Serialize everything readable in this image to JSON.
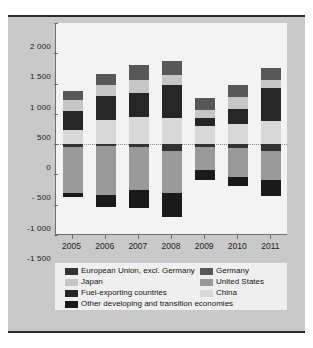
{
  "figure": {
    "panel_color": "#c9c9c9",
    "plot_bg": "#f3f3f3",
    "rule_color": "#2b2b2b"
  },
  "chart_data": {
    "type": "bar",
    "subtype": "stacked-bar-diverging",
    "title": "",
    "subtitle": "",
    "xlabel": "",
    "ylabel": "",
    "categories": [
      "2005",
      "2006",
      "2007",
      "2008",
      "2009",
      "2010",
      "2011"
    ],
    "ylim": [
      -1500,
      2000
    ],
    "yticks": [
      2000,
      1500,
      1000,
      500,
      0,
      -500,
      -1000,
      -1500
    ],
    "ytick_labels": [
      "2 000",
      "1 500",
      "1 000",
      "500",
      "0",
      "- 500",
      "-1 000",
      "-1 500"
    ],
    "grid": false,
    "zero_line": true,
    "legend_position": "bottom",
    "series": [
      {
        "name": "European Union, excl. Germany",
        "key": "eu_excl_germany",
        "color": "#333333",
        "values": [
          -55,
          -35,
          -40,
          -110,
          -40,
          -70,
          -120
        ]
      },
      {
        "name": "Germany",
        "key": "germany",
        "color": "#585858",
        "values": [
          145,
          190,
          250,
          235,
          200,
          200,
          205
        ]
      },
      {
        "name": "Japan",
        "key": "japan",
        "color": "#c6c6c6",
        "values": [
          170,
          175,
          210,
          155,
          145,
          205,
          125
        ]
      },
      {
        "name": "United States",
        "key": "united_states",
        "color": "#9a9a9a",
        "values": [
          -745,
          -805,
          -715,
          -700,
          -380,
          -470,
          -465
        ]
      },
      {
        "name": "Fuel-exporting countries",
        "key": "fuel_exporting",
        "color": "#262626",
        "values": [
          325,
          400,
          410,
          555,
          125,
          245,
          555
        ]
      },
      {
        "name": "China",
        "key": "china",
        "color": "#d8d8d8",
        "values": [
          230,
          395,
          440,
          425,
          300,
          330,
          375
        ]
      },
      {
        "name": "Other developing and transition economies",
        "key": "other_dev_transition",
        "color": "#1a1a1a",
        "values": [
          -75,
          -190,
          -300,
          -385,
          -175,
          -155,
          -270
        ]
      }
    ],
    "stack_order_positive": [
      "china",
      "fuel_exporting",
      "japan",
      "germany"
    ],
    "stack_order_negative": [
      "eu_excl_germany",
      "united_states",
      "other_dev_transition"
    ]
  },
  "legend": {
    "entries": [
      {
        "label": "European Union, excl. Germany",
        "color": "#333333",
        "row": 0,
        "col": 0
      },
      {
        "label": "Germany",
        "color": "#585858",
        "row": 0,
        "col": 1
      },
      {
        "label": "Japan",
        "color": "#c6c6c6",
        "row": 1,
        "col": 0
      },
      {
        "label": "United States",
        "color": "#9a9a9a",
        "row": 1,
        "col": 1
      },
      {
        "label": "Fuel-exporting countries",
        "color": "#262626",
        "row": 2,
        "col": 0
      },
      {
        "label": "China",
        "color": "#d8d8d8",
        "row": 2,
        "col": 1
      },
      {
        "label": "Other developing and transition economies",
        "color": "#1a1a1a",
        "row": 3,
        "col": 0
      }
    ]
  }
}
